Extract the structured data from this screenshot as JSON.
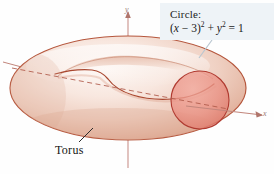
{
  "figure": {
    "background_color": "#fefefe"
  },
  "callout": {
    "name": "circle-equation-callout",
    "label": "Circle:",
    "equation_plain": "(x − 3)² + y² = 1",
    "equation_parts": {
      "open_paren": "(",
      "var_x": "x",
      "minus": " − ",
      "const_3": "3",
      "close_paren": ")",
      "exp_2a": "2",
      "plus": " + ",
      "var_y": "y",
      "exp_2b": "2",
      "equals": " = ",
      "result": "1"
    },
    "background_color": "#eef3f7",
    "text_color": "#1a1a1a"
  },
  "annotations": {
    "torus_label": "Torus",
    "torus_label_color": "#141414"
  },
  "axes": {
    "y_label": "y",
    "x_label": "x",
    "axis_color": "#c2867c",
    "arrow_color": "#b0756b"
  },
  "colors": {
    "torus_light": "#fbf1ec",
    "torus_mid": "#edcdc0",
    "torus_shadow": "#dda894",
    "torus_outline": "#b5563c",
    "circle_fill": "#e8897e",
    "circle_stroke": "#b03a30",
    "dashed_line": "#b05a4a",
    "leader_line": "#b9c6d0"
  },
  "geometry": {
    "torus_center_x": 128,
    "torus_center_y": 88,
    "outer_rx": 118,
    "outer_ry": 52,
    "generating_circle_cx": 200,
    "generating_circle_cy": 100,
    "generating_circle_r": 29
  }
}
